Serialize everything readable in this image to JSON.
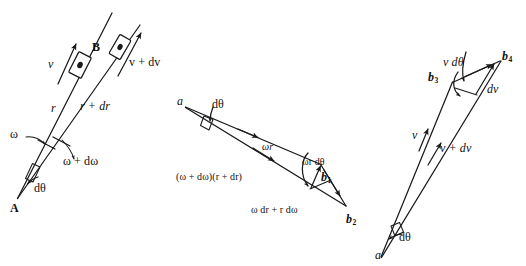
{
  "figure": {
    "kind": "vector-kinematics-diagram",
    "background_color": "#ffffff",
    "ink_color": "#1a1a1a",
    "panel_count": 3
  },
  "panel_left": {
    "name": "position-vectors-panel",
    "labels": {
      "point_a": "A",
      "point_b": "B",
      "r": "r",
      "r_plus_dr": "r + dr",
      "v": "v",
      "v_plus_dv": "v + dv",
      "omega": "ω",
      "omega_plus_domega": "ω + dω",
      "dtheta": "dθ"
    }
  },
  "panel_middle": {
    "name": "velocity-triangle-panel",
    "labels": {
      "apex_a": "a",
      "dtheta": "dθ",
      "omega_r": "ωr",
      "omega_r_dtheta": "ωr dθ",
      "b1": "b",
      "b1_sub": "1",
      "b2": "b",
      "b2_sub": "2",
      "omega_dr_plus_r_domega": "ω dr + r dω",
      "omega_domega_r_dr": "(ω + dω)(r + dr)"
    }
  },
  "panel_right": {
    "name": "acceleration-triangle-panel",
    "labels": {
      "apex_a": "a",
      "dtheta": "dθ",
      "v": "v",
      "v_plus_dv": "v + dv",
      "v_dtheta": "v dθ",
      "dv": "dv",
      "b3": "b",
      "b3_sub": "3",
      "b4": "b",
      "b4_sub": "4"
    }
  }
}
